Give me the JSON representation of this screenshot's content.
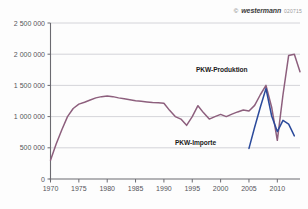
{
  "credit": {
    "copyright_symbol": "©",
    "brand": "westermann",
    "code": "020715"
  },
  "labels": {
    "produktion": "PKW-Produktion",
    "importe": "PKW-Importe"
  },
  "chart_data": {
    "type": "line",
    "title": "",
    "subtitle": "",
    "xlabel": "",
    "ylabel": "",
    "xlim": [
      1970,
      2014
    ],
    "ylim": [
      0,
      2500000
    ],
    "xticks": [
      1970,
      1975,
      1980,
      1985,
      1990,
      1995,
      2000,
      2005,
      2010
    ],
    "xticklabels": [
      "1970",
      "1975",
      "1980",
      "1985",
      "1990",
      "1995",
      "2000",
      "2005",
      "2010"
    ],
    "yticks": [
      0,
      500000,
      1000000,
      1500000,
      2000000,
      2500000
    ],
    "yticklabels": [
      "0",
      "500 000",
      "1 000 000",
      "1 500 000",
      "2 000 000",
      "2 500 000"
    ],
    "grid": "horizontal",
    "legend_position": "inline-annotation",
    "colors": {
      "produktion": "#8d5f7d",
      "importe": "#2b4a9b",
      "grid": "#c9c9cf",
      "axis": "#6b6a70",
      "text": "#55545a"
    },
    "series": [
      {
        "name": "PKW-Produktion",
        "color": "#8d5f7d",
        "x": [
          1970,
          1971,
          1972,
          1973,
          1974,
          1975,
          1976,
          1977,
          1978,
          1979,
          1980,
          1981,
          1982,
          1983,
          1984,
          1985,
          1986,
          1987,
          1988,
          1989,
          1990,
          1991,
          1992,
          1993,
          1994,
          1995,
          1996,
          1997,
          1998,
          1999,
          2000,
          2001,
          2002,
          2003,
          2004,
          2005,
          2006,
          2007,
          2008,
          2009,
          2010,
          2011,
          2012,
          2013
        ],
        "values": [
          300000,
          560000,
          790000,
          1000000,
          1130000,
          1200000,
          1230000,
          1265000,
          1300000,
          1320000,
          1330000,
          1320000,
          1300000,
          1285000,
          1270000,
          1255000,
          1245000,
          1235000,
          1225000,
          1220000,
          1215000,
          1100000,
          1000000,
          960000,
          860000,
          1000000,
          1175000,
          1060000,
          960000,
          1000000,
          1035000,
          1000000,
          1040000,
          1075000,
          1105000,
          1090000,
          1180000,
          1350000,
          1500000,
          1150000,
          620000,
          1350000,
          1980000,
          2000000
        ],
        "endpoint_value": 1720000
      },
      {
        "name": "PKW-Importe",
        "color": "#2b4a9b",
        "x": [
          2005,
          2006,
          2007,
          2008,
          2009,
          2010,
          2011,
          2012,
          2013
        ],
        "values": [
          490000,
          830000,
          1150000,
          1450000,
          1010000,
          760000,
          940000,
          880000,
          690000
        ]
      }
    ]
  }
}
